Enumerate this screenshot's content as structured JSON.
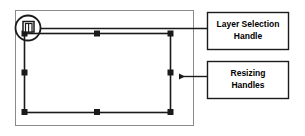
{
  "figure": {
    "background_color": "#ffffff",
    "line_color": "#1a1a1a",
    "frame_color": "#8a8a8a",
    "handle_color": "#1a1a1a"
  },
  "canvas_frame": {
    "name": "document-canvas-frame",
    "x": 15,
    "y": 10,
    "width": 179,
    "height": 116
  },
  "selection": {
    "name": "layer-selection-bounding-box",
    "x": 24,
    "y": 33,
    "width": 146,
    "height": 79,
    "handle_size": 6,
    "handles": [
      {
        "name": "handle-top-left",
        "x": 24,
        "y": 33
      },
      {
        "name": "handle-top-center",
        "x": 97,
        "y": 33
      },
      {
        "name": "handle-top-right",
        "x": 170,
        "y": 33
      },
      {
        "name": "handle-middle-left",
        "x": 24,
        "y": 72
      },
      {
        "name": "handle-middle-right",
        "x": 170,
        "y": 72
      },
      {
        "name": "handle-bottom-left",
        "x": 24,
        "y": 112
      },
      {
        "name": "handle-bottom-center",
        "x": 97,
        "y": 112
      },
      {
        "name": "handle-bottom-right",
        "x": 170,
        "y": 112
      }
    ]
  },
  "layer_handle": {
    "name": "layer-selection-handle",
    "circle_cx": 28,
    "circle_cy": 28,
    "circle_r": 13,
    "icon_name": "stacked-layers-icon"
  },
  "callouts": [
    {
      "id": "layer-selection-handle",
      "name": "callout-layer-selection-handle",
      "lines": [
        "Layer Selection",
        "Handle"
      ],
      "box": {
        "x": 207,
        "y": 12,
        "width": 82,
        "height": 38
      },
      "leader": {
        "from_x": 41,
        "from_y": 28,
        "to_x": 207,
        "to_y": 28,
        "arrow": false
      }
    },
    {
      "id": "resizing-handles",
      "name": "callout-resizing-handles",
      "lines": [
        "Resizing",
        "Handles"
      ],
      "box": {
        "x": 207,
        "y": 61,
        "width": 82,
        "height": 38
      },
      "leader": {
        "from_x": 207,
        "from_y": 77,
        "to_x": 177,
        "to_y": 77,
        "arrow": true
      }
    }
  ]
}
